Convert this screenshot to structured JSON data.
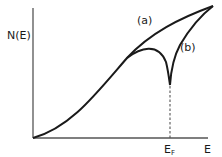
{
  "diagram": {
    "y_axis_label": "N(E)",
    "x_axis_label": "E",
    "fermi_label_main": "E",
    "fermi_label_sub": "F",
    "curves": [
      {
        "id": "a",
        "label": "(a)",
        "description": "smooth monotonically increasing density of states"
      },
      {
        "id": "b",
        "label": "(b)",
        "description": "density of states with a dip (pseudogap) at the Fermi energy"
      }
    ],
    "colors": {
      "line": "#1a1a1a",
      "background": "#ffffff",
      "axis": "#555555"
    }
  }
}
